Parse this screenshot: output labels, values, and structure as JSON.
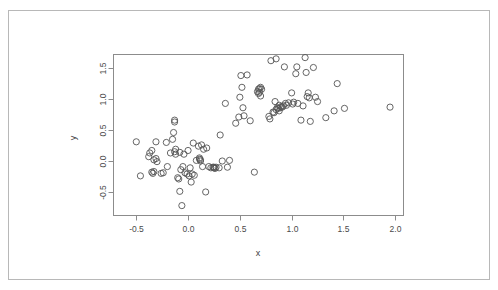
{
  "figure": {
    "background_color": "#ffffff",
    "frame_color": "#b8b8b8",
    "axis_color": "#8c8c8c",
    "point_color": "#555555"
  },
  "chart_data": {
    "type": "scatter",
    "title": "",
    "xlabel": "x",
    "ylabel": "y",
    "xlim": [
      -0.72,
      2.08
    ],
    "ylim": [
      -0.88,
      1.72
    ],
    "xticks": [
      -0.5,
      0.0,
      0.5,
      1.0,
      1.5,
      2.0
    ],
    "xticklabels": [
      "-0.5",
      "0.0",
      "0.5",
      "1.0",
      "1.5",
      "2.0"
    ],
    "yticks": [
      -0.5,
      0.0,
      0.5,
      1.0,
      1.5
    ],
    "yticklabels": [
      "-0.5",
      "0.0",
      "0.5",
      "1.0",
      "1.5"
    ],
    "grid": false,
    "legend": null,
    "marker": "open-circle",
    "marker_size": 3.1,
    "points": [
      [
        -0.5,
        0.31
      ],
      [
        -0.46,
        -0.24
      ],
      [
        -0.38,
        0.07
      ],
      [
        -0.37,
        0.13
      ],
      [
        -0.35,
        0.17
      ],
      [
        -0.35,
        -0.18
      ],
      [
        -0.34,
        -0.2
      ],
      [
        -0.33,
        0.02
      ],
      [
        -0.33,
        -0.17
      ],
      [
        -0.31,
        0.31
      ],
      [
        -0.31,
        0.04
      ],
      [
        -0.3,
        -0.01
      ],
      [
        -0.26,
        -0.2
      ],
      [
        -0.24,
        -0.19
      ],
      [
        -0.21,
        0.3
      ],
      [
        -0.2,
        -0.09
      ],
      [
        -0.17,
        0.13
      ],
      [
        -0.15,
        0.35
      ],
      [
        -0.14,
        0.46
      ],
      [
        -0.13,
        0.66
      ],
      [
        -0.13,
        0.63
      ],
      [
        -0.13,
        0.15
      ],
      [
        -0.12,
        0.19
      ],
      [
        -0.12,
        0.11
      ],
      [
        -0.1,
        -0.27
      ],
      [
        -0.09,
        -0.29
      ],
      [
        -0.08,
        0.14
      ],
      [
        -0.08,
        -0.49
      ],
      [
        -0.07,
        -0.14
      ],
      [
        -0.06,
        -0.72
      ],
      [
        -0.05,
        -0.09
      ],
      [
        -0.04,
        0.11
      ],
      [
        -0.03,
        -0.19
      ],
      [
        -0.01,
        -0.21
      ],
      [
        0.0,
        0.17
      ],
      [
        0.01,
        -0.24
      ],
      [
        0.02,
        -0.11
      ],
      [
        0.03,
        -0.34
      ],
      [
        0.04,
        -0.21
      ],
      [
        0.05,
        0.29
      ],
      [
        0.06,
        -0.23
      ],
      [
        0.08,
        0.01
      ],
      [
        0.1,
        0.24
      ],
      [
        0.11,
        0.03
      ],
      [
        0.11,
        0.05
      ],
      [
        0.12,
        0.02
      ],
      [
        0.12,
        0.0
      ],
      [
        0.13,
        0.26
      ],
      [
        0.14,
        -0.09
      ],
      [
        0.15,
        0.19
      ],
      [
        0.17,
        -0.5
      ],
      [
        0.18,
        0.21
      ],
      [
        0.2,
        -0.09
      ],
      [
        0.22,
        -0.11
      ],
      [
        0.24,
        -0.1
      ],
      [
        0.25,
        -0.11
      ],
      [
        0.25,
        -0.1
      ],
      [
        0.26,
        -0.12
      ],
      [
        0.27,
        -0.1
      ],
      [
        0.3,
        -0.11
      ],
      [
        0.31,
        0.42
      ],
      [
        0.33,
        0.0
      ],
      [
        0.36,
        0.93
      ],
      [
        0.38,
        -0.1
      ],
      [
        0.4,
        0.01
      ],
      [
        0.46,
        0.61
      ],
      [
        0.49,
        0.71
      ],
      [
        0.5,
        1.03
      ],
      [
        0.51,
        1.38
      ],
      [
        0.52,
        1.19
      ],
      [
        0.53,
        0.86
      ],
      [
        0.54,
        0.73
      ],
      [
        0.57,
        1.39
      ],
      [
        0.6,
        0.65
      ],
      [
        0.64,
        -0.18
      ],
      [
        0.67,
        1.12
      ],
      [
        0.68,
        1.16
      ],
      [
        0.68,
        1.09
      ],
      [
        0.69,
        1.17
      ],
      [
        0.69,
        1.11
      ],
      [
        0.7,
        1.19
      ],
      [
        0.7,
        1.05
      ],
      [
        0.71,
        1.16
      ],
      [
        0.78,
        0.72
      ],
      [
        0.79,
        0.68
      ],
      [
        0.8,
        1.62
      ],
      [
        0.82,
        0.79
      ],
      [
        0.83,
        0.78
      ],
      [
        0.84,
        0.96
      ],
      [
        0.85,
        1.65
      ],
      [
        0.85,
        0.83
      ],
      [
        0.86,
        0.86
      ],
      [
        0.87,
        0.85
      ],
      [
        0.88,
        0.81
      ],
      [
        0.88,
        0.9
      ],
      [
        0.89,
        0.86
      ],
      [
        0.9,
        0.88
      ],
      [
        0.91,
        0.87
      ],
      [
        0.92,
        0.89
      ],
      [
        0.93,
        1.52
      ],
      [
        0.94,
        0.93
      ],
      [
        0.95,
        0.9
      ],
      [
        0.97,
        0.94
      ],
      [
        1.0,
        1.1
      ],
      [
        1.01,
        0.92
      ],
      [
        1.02,
        0.95
      ],
      [
        1.04,
        1.41
      ],
      [
        1.05,
        1.52
      ],
      [
        1.06,
        0.93
      ],
      [
        1.09,
        0.66
      ],
      [
        1.11,
        0.89
      ],
      [
        1.13,
        1.67
      ],
      [
        1.14,
        1.43
      ],
      [
        1.15,
        1.04
      ],
      [
        1.16,
        1.1
      ],
      [
        1.17,
        1.02
      ],
      [
        1.18,
        0.64
      ],
      [
        1.21,
        1.51
      ],
      [
        1.23,
        1.03
      ],
      [
        1.25,
        0.96
      ],
      [
        1.33,
        0.7
      ],
      [
        1.41,
        0.81
      ],
      [
        1.44,
        1.25
      ],
      [
        1.51,
        0.85
      ],
      [
        1.95,
        0.87
      ]
    ]
  }
}
